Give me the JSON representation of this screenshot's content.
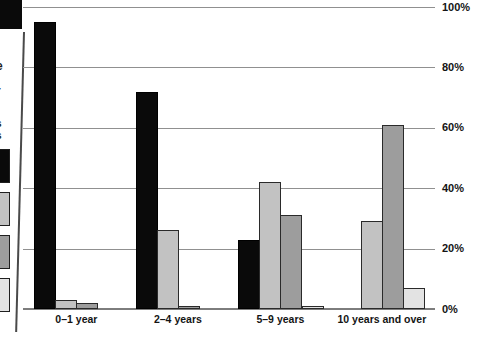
{
  "cut_page_edge": {
    "text_fragments": [
      "t",
      "e",
      "t",
      "r",
      ".",
      "s",
      "s"
    ],
    "legend_swatches": [
      {
        "name": "black",
        "color": "#0a0a0a"
      },
      {
        "name": "light-gray",
        "color": "#c2c2c2"
      },
      {
        "name": "medium-gray",
        "color": "#9d9d9d"
      },
      {
        "name": "pale-gray",
        "color": "#e3e3e3"
      }
    ]
  },
  "chart_data": {
    "type": "bar",
    "grouped": true,
    "title": "",
    "xlabel": "",
    "ylabel": "",
    "categories": [
      "0–1 year",
      "2–4 years",
      "5–9 years",
      "10 years and over"
    ],
    "series": [
      {
        "name": "black",
        "color": "#0a0a0a",
        "values": [
          95,
          72,
          23,
          0
        ]
      },
      {
        "name": "light-gray",
        "color": "#c2c2c2",
        "values": [
          3,
          26,
          42,
          29
        ]
      },
      {
        "name": "medium-gray",
        "color": "#9d9d9d",
        "values": [
          2,
          1,
          31,
          61
        ]
      },
      {
        "name": "pale-gray",
        "color": "#e3e3e3",
        "values": [
          0,
          0,
          1,
          7
        ]
      }
    ],
    "ylim": [
      0,
      100
    ],
    "y_ticks": [
      0,
      20,
      40,
      60,
      80,
      100
    ],
    "y_tick_labels": [
      "0%",
      "20%",
      "40%",
      "60%",
      "80%",
      "100%"
    ],
    "y_axis_side": "right",
    "grid": true,
    "legend_position": "cropped-left"
  },
  "colors": {
    "gridline": "#909090",
    "axis": "#7d7d7d",
    "text": "#141414",
    "bar_border": "#2a2a2a",
    "page_rule": "#4a4a4a"
  }
}
